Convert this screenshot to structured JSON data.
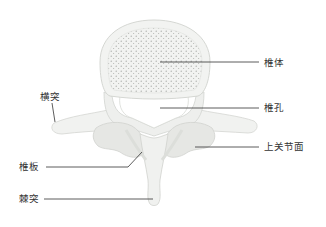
{
  "diagram": {
    "colors": {
      "background": "#ffffff",
      "bone_fill": "#f3f4f2",
      "bone_shadow": "#e2e3e0",
      "bone_outline": "#d0d2ce",
      "cancellous_dots": "#9a9c98",
      "leader_line": "#333333",
      "label_text": "#333333"
    },
    "labels": [
      {
        "id": "vertebral-body",
        "text": "椎体",
        "x": 264,
        "y": 57
      },
      {
        "id": "vertebral-foramen",
        "text": "椎孔",
        "x": 264,
        "y": 102
      },
      {
        "id": "transverse-process",
        "text": "横突",
        "x": 40,
        "y": 91
      },
      {
        "id": "superior-articular-surface",
        "text": "上关节面",
        "x": 264,
        "y": 143
      },
      {
        "id": "lamina",
        "text": "椎板",
        "x": 19,
        "y": 162
      },
      {
        "id": "spinous-process",
        "text": "棘突",
        "x": 19,
        "y": 196
      }
    ]
  }
}
